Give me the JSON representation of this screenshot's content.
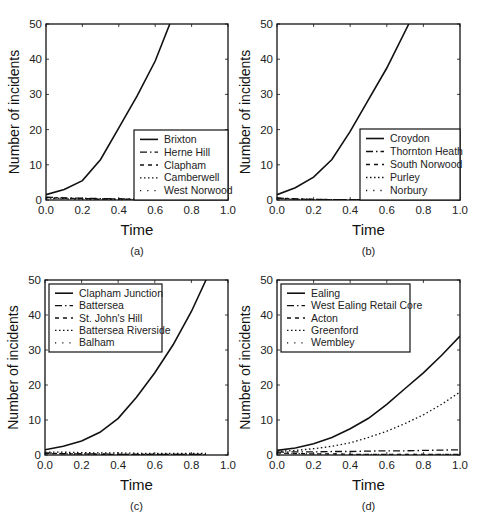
{
  "chart_data": [
    {
      "type": "line",
      "panel": "(a)",
      "title": "",
      "xlabel": "Time",
      "ylabel": "Number of incidents",
      "xlim": [
        0,
        1
      ],
      "ylim": [
        0,
        50
      ],
      "xticks": [
        "0.0",
        "0.2",
        "0.4",
        "0.6",
        "0.8",
        "1.0"
      ],
      "yticks": [
        "0",
        "10",
        "20",
        "30",
        "40",
        "50"
      ],
      "grid": false,
      "legend_position": "lower right",
      "x": [
        0.0,
        0.1,
        0.2,
        0.3,
        0.4,
        0.5,
        0.6,
        0.68
      ],
      "series": [
        {
          "name": "Brixton",
          "style": "solid",
          "values": [
            1.5,
            3.0,
            5.5,
            11.5,
            20.5,
            29.5,
            39.5,
            50
          ]
        },
        {
          "name": "Herne Hill",
          "style": "dashdot",
          "values": [
            0.8,
            0.6,
            0.5,
            0.4,
            0.3,
            0.3,
            0.3,
            0.3
          ]
        },
        {
          "name": "Clapham",
          "style": "dashed",
          "values": [
            0.7,
            0.5,
            0.4,
            0.3,
            0.3,
            0.2,
            0.2,
            0.2
          ]
        },
        {
          "name": "Camberwell",
          "style": "dotted",
          "values": [
            0.6,
            0.4,
            0.3,
            0.2,
            0.2,
            0.2,
            0.2,
            0.2
          ]
        },
        {
          "name": "West Norwood",
          "style": "sparse-dotted",
          "values": [
            0.5,
            0.3,
            0.2,
            0.2,
            0.1,
            0.1,
            0.1,
            0.1
          ]
        }
      ]
    },
    {
      "type": "line",
      "panel": "(b)",
      "title": "",
      "xlabel": "Time",
      "ylabel": "Number of incidents",
      "xlim": [
        0,
        1
      ],
      "ylim": [
        0,
        50
      ],
      "xticks": [
        "0.0",
        "0.2",
        "0.4",
        "0.6",
        "0.8",
        "1.0"
      ],
      "yticks": [
        "0",
        "10",
        "20",
        "30",
        "40",
        "50"
      ],
      "grid": false,
      "legend_position": "lower right",
      "x": [
        0.0,
        0.1,
        0.2,
        0.3,
        0.4,
        0.5,
        0.6,
        0.72
      ],
      "series": [
        {
          "name": "Croydon",
          "style": "solid",
          "values": [
            1.5,
            3.5,
            6.5,
            11.5,
            19.5,
            28.5,
            37.5,
            50
          ]
        },
        {
          "name": "Thornton Heath",
          "style": "dashdot",
          "values": [
            0.6,
            0.3,
            0.2,
            0.1,
            0.1,
            0.1,
            0.1,
            0.1
          ]
        },
        {
          "name": "South Norwood",
          "style": "dashed",
          "values": [
            0.5,
            0.3,
            0.2,
            0.1,
            0.1,
            0.1,
            0.1,
            0.1
          ]
        },
        {
          "name": "Purley",
          "style": "dotted",
          "values": [
            0.4,
            0.2,
            0.1,
            0.1,
            0.1,
            0.0,
            0.0,
            0.0
          ]
        },
        {
          "name": "Norbury",
          "style": "sparse-dotted",
          "values": [
            0.3,
            0.2,
            0.1,
            0.1,
            0.0,
            0.0,
            0.0,
            0.0
          ]
        }
      ]
    },
    {
      "type": "line",
      "panel": "(c)",
      "title": "",
      "xlabel": "Time",
      "ylabel": "Number of incidents",
      "xlim": [
        0,
        1
      ],
      "ylim": [
        0,
        50
      ],
      "xticks": [
        "0.0",
        "0.2",
        "0.4",
        "0.6",
        "0.8",
        "1.0"
      ],
      "yticks": [
        "0",
        "10",
        "20",
        "30",
        "40",
        "50"
      ],
      "grid": false,
      "legend_position": "upper left",
      "x": [
        0.0,
        0.1,
        0.2,
        0.3,
        0.4,
        0.5,
        0.6,
        0.7,
        0.8,
        0.88
      ],
      "series": [
        {
          "name": "Clapham Junction",
          "style": "solid",
          "values": [
            1.5,
            2.5,
            4.0,
            6.5,
            10.5,
            16.5,
            23.5,
            31.5,
            41.0,
            50
          ]
        },
        {
          "name": "Battersea",
          "style": "dashdot",
          "values": [
            0.6,
            0.4,
            0.3,
            0.3,
            0.2,
            0.2,
            0.2,
            0.2,
            0.2,
            0.2
          ]
        },
        {
          "name": "St. John's Hill",
          "style": "dashed",
          "values": [
            0.5,
            0.3,
            0.3,
            0.2,
            0.2,
            0.2,
            0.2,
            0.2,
            0.2,
            0.2
          ]
        },
        {
          "name": "Battersea Riverside",
          "style": "dotted",
          "values": [
            0.8,
            0.8,
            0.7,
            0.6,
            0.6,
            0.5,
            0.5,
            0.5,
            0.5,
            0.5
          ]
        },
        {
          "name": "Balham",
          "style": "sparse-dotted",
          "values": [
            0.4,
            0.3,
            0.2,
            0.2,
            0.2,
            0.1,
            0.1,
            0.1,
            0.1,
            0.1
          ]
        }
      ]
    },
    {
      "type": "line",
      "panel": "(d)",
      "title": "",
      "xlabel": "Time",
      "ylabel": "Number of incidents",
      "xlim": [
        0,
        1
      ],
      "ylim": [
        0,
        50
      ],
      "xticks": [
        "0.0",
        "0.2",
        "0.4",
        "0.6",
        "0.8",
        "1.0"
      ],
      "yticks": [
        "0",
        "10",
        "20",
        "30",
        "40",
        "50"
      ],
      "grid": false,
      "legend_position": "upper left",
      "x": [
        0.0,
        0.1,
        0.2,
        0.3,
        0.4,
        0.5,
        0.6,
        0.7,
        0.8,
        0.9,
        1.0
      ],
      "series": [
        {
          "name": "Ealing",
          "style": "solid",
          "values": [
            1.3,
            2.0,
            3.2,
            5.0,
            7.5,
            10.5,
            14.5,
            19.0,
            23.5,
            28.5,
            34.0
          ]
        },
        {
          "name": "West Ealing Retail Core",
          "style": "dashdot",
          "values": [
            0.8,
            0.9,
            0.9,
            1.0,
            1.0,
            1.1,
            1.2,
            1.2,
            1.3,
            1.4,
            1.5
          ]
        },
        {
          "name": "Acton",
          "style": "dashed",
          "values": [
            0.6,
            0.4,
            0.3,
            0.3,
            0.2,
            0.2,
            0.2,
            0.2,
            0.2,
            0.2,
            0.2
          ]
        },
        {
          "name": "Greenford",
          "style": "dotted",
          "values": [
            1.0,
            1.3,
            1.8,
            2.5,
            3.5,
            5.0,
            6.8,
            9.0,
            11.5,
            14.5,
            18.0
          ]
        },
        {
          "name": "Wembley",
          "style": "sparse-dotted",
          "values": [
            0.5,
            0.4,
            0.3,
            0.3,
            0.2,
            0.2,
            0.2,
            0.2,
            0.2,
            0.2,
            0.2
          ]
        }
      ]
    }
  ],
  "layout": {
    "panels": [
      {
        "left": 46,
        "top": 24,
        "width": 182,
        "height": 176,
        "legend": {
          "x": 134,
          "y": 130,
          "w": 94,
          "h": 70,
          "leftAlign": false
        }
      },
      {
        "left": 277,
        "top": 24,
        "width": 183,
        "height": 176,
        "legend": {
          "x": 360,
          "y": 129,
          "w": 100,
          "h": 71,
          "leftAlign": false
        }
      },
      {
        "left": 45,
        "top": 280,
        "width": 183,
        "height": 175,
        "legend": {
          "x": 49,
          "y": 284,
          "w": 113,
          "h": 68,
          "leftAlign": true
        }
      },
      {
        "left": 277,
        "top": 280,
        "width": 183,
        "height": 175,
        "legend": {
          "x": 281,
          "y": 284,
          "w": 129,
          "h": 68,
          "leftAlign": true
        }
      }
    ]
  }
}
